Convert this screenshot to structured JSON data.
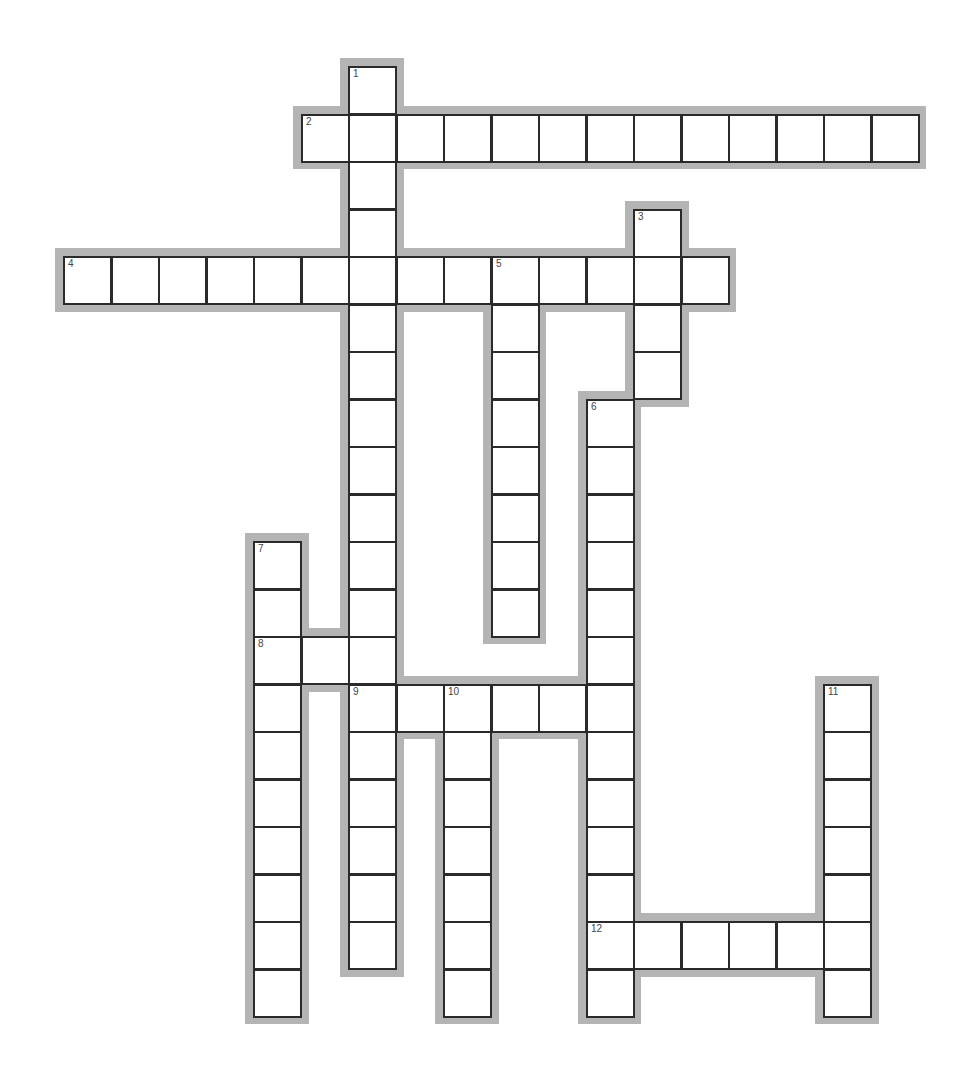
{
  "puzzle": {
    "type": "crossword",
    "grid_origin": {
      "x": 63,
      "y": 66
    },
    "cell_size": 47.5,
    "colors": {
      "halo": "#b4b4b4",
      "cell_border": "#2a2a2a",
      "cell_fill": "#ffffff",
      "number": "#444444"
    },
    "entries": [
      {
        "number": "1",
        "direction": "down",
        "row": 0,
        "col": 6,
        "length": 19
      },
      {
        "number": "2",
        "direction": "across",
        "row": 1,
        "col": 5,
        "length": 13
      },
      {
        "number": "3",
        "direction": "down",
        "row": 3,
        "col": 12,
        "length": 4
      },
      {
        "number": "4",
        "direction": "across",
        "row": 4,
        "col": 0,
        "length": 14
      },
      {
        "number": "5",
        "direction": "down",
        "row": 4,
        "col": 9,
        "length": 8
      },
      {
        "number": "6",
        "direction": "down",
        "row": 7,
        "col": 11,
        "length": 13
      },
      {
        "number": "7",
        "direction": "down",
        "row": 10,
        "col": 4,
        "length": 10
      },
      {
        "number": "8",
        "direction": "across",
        "row": 12,
        "col": 4,
        "length": 3
      },
      {
        "number": "9",
        "direction": "across",
        "row": 13,
        "col": 6,
        "length": 6
      },
      {
        "number": "10",
        "direction": "down",
        "row": 13,
        "col": 8,
        "length": 7
      },
      {
        "number": "11",
        "direction": "down",
        "row": 13,
        "col": 16,
        "length": 7
      },
      {
        "number": "12",
        "direction": "across",
        "row": 18,
        "col": 11,
        "length": 6
      }
    ]
  }
}
